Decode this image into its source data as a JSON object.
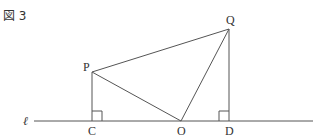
{
  "figure": {
    "title": "図 3",
    "line_label": "ℓ",
    "points": {
      "P": {
        "label": "P",
        "x": 92,
        "y": 72
      },
      "Q": {
        "label": "Q",
        "x": 229,
        "y": 29
      },
      "C": {
        "label": "C",
        "x": 92,
        "y": 121
      },
      "O": {
        "label": "O",
        "x": 181,
        "y": 121
      },
      "D": {
        "label": "D",
        "x": 229,
        "y": 121
      }
    },
    "segments": [
      "PQ",
      "PO",
      "QO",
      "PC",
      "QD"
    ],
    "right_angles": [
      "C",
      "D"
    ],
    "colors": {
      "line": "#555555",
      "text": "#333333"
    }
  }
}
